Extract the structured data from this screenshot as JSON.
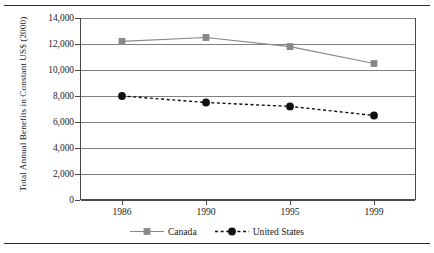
{
  "chart_data": {
    "type": "line",
    "title": "",
    "subtitle": "",
    "xlabel": "",
    "ylabel": "Total Annual Benefits in Constant US$ (2000)",
    "categories": [
      "1986",
      "1990",
      "1995",
      "1999"
    ],
    "yticks": [
      "0",
      "2,000",
      "4,000",
      "6,000",
      "8,000",
      "10,000",
      "12,000",
      "14,000"
    ],
    "ytick_values": [
      0,
      2000,
      4000,
      6000,
      8000,
      10000,
      12000,
      14000
    ],
    "ylim": [
      0,
      14000
    ],
    "grid": "horizontal",
    "legend_position": "bottom-center",
    "series": [
      {
        "name": "Canada",
        "values": [
          12200,
          12500,
          11800,
          10500
        ],
        "color": "#888888",
        "line_style": "solid",
        "marker": "square"
      },
      {
        "name": "United States",
        "values": [
          8000,
          7500,
          7200,
          6500
        ],
        "color": "#111111",
        "line_style": "dashed",
        "marker": "circle"
      }
    ]
  },
  "legend": {
    "items": [
      {
        "label": "Canada",
        "marker": "square-marker",
        "line": "solid-line-swatch"
      },
      {
        "label": "United States",
        "marker": "circle-marker",
        "line": "dashed-line-swatch"
      }
    ]
  },
  "colors": {
    "canada": "#888888",
    "united_states": "#111111",
    "gridline": "#808080",
    "axis": "#4a4a4a",
    "rule": "#2b2b2b",
    "background": "#ffffff"
  }
}
